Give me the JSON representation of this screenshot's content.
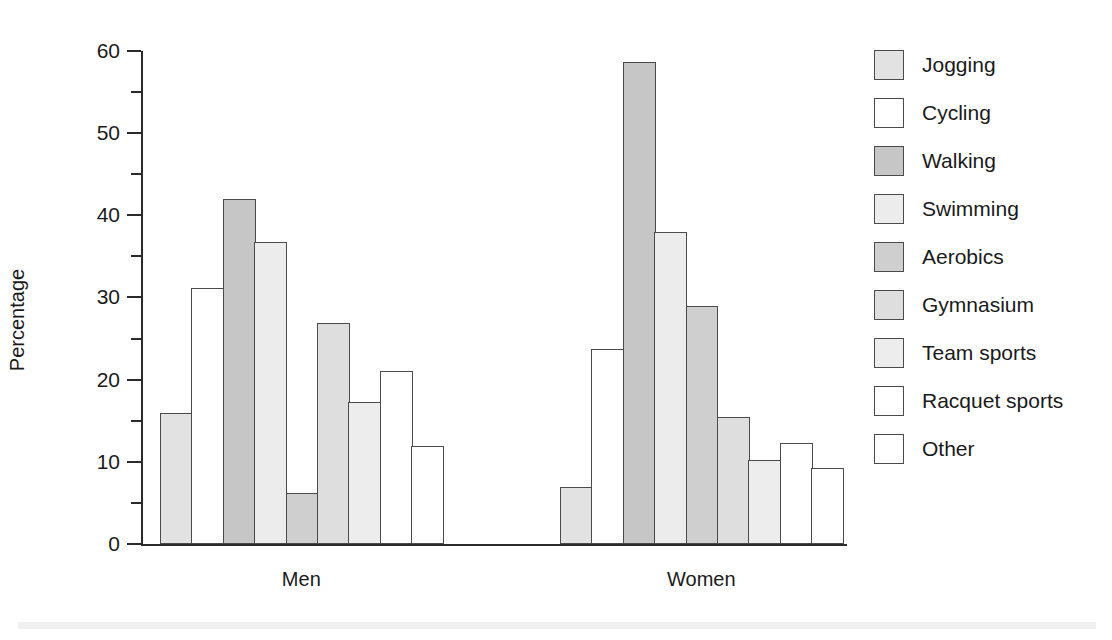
{
  "chart_data": {
    "type": "bar",
    "title": "",
    "xlabel": "",
    "ylabel": "Percentage",
    "ylim": [
      0,
      60
    ],
    "y_ticks_major": [
      0,
      10,
      20,
      30,
      40,
      50,
      60
    ],
    "y_tick_labels": [
      "0",
      "10",
      "20",
      "30",
      "40",
      "50",
      "60"
    ],
    "y_ticks_minor": [
      5,
      15,
      25,
      35,
      45,
      55
    ],
    "grid": false,
    "legend_position": "right",
    "categories": [
      "Men",
      "Women"
    ],
    "series": [
      {
        "name": "Jogging",
        "values": [
          15.9,
          6.9
        ],
        "color": "#e2e2e2"
      },
      {
        "name": "Cycling",
        "values": [
          31.2,
          23.7
        ],
        "color": "#ffffff"
      },
      {
        "name": "Walking",
        "values": [
          42.0,
          58.7
        ],
        "color": "#c6c6c6"
      },
      {
        "name": "Swimming",
        "values": [
          36.8,
          38.0
        ],
        "color": "#ececec"
      },
      {
        "name": "Aerobics",
        "values": [
          6.2,
          29.0
        ],
        "color": "#cfcfcf"
      },
      {
        "name": "Gymnasium",
        "values": [
          26.9,
          15.4
        ],
        "color": "#dedede"
      },
      {
        "name": "Team sports",
        "values": [
          17.3,
          10.2
        ],
        "color": "#ededed"
      },
      {
        "name": "Racquet sports",
        "values": [
          21.1,
          12.3
        ],
        "color": "#ffffff"
      },
      {
        "name": "Other",
        "values": [
          11.9,
          9.3
        ],
        "color": "#ffffff"
      }
    ]
  },
  "axes": {
    "y_title": "Percentage",
    "group_labels": [
      "Men",
      "Women"
    ]
  },
  "legend": {
    "entries": [
      {
        "label": "Jogging",
        "swatch": "#e2e2e2"
      },
      {
        "label": "Cycling",
        "swatch": "#ffffff"
      },
      {
        "label": "Walking",
        "swatch": "#c6c6c6"
      },
      {
        "label": "Swimming",
        "swatch": "#ececec"
      },
      {
        "label": "Aerobics",
        "swatch": "#cfcfcf"
      },
      {
        "label": "Gymnasium",
        "swatch": "#dedede"
      },
      {
        "label": "Team sports",
        "swatch": "#ededed"
      },
      {
        "label": "Racquet sports",
        "swatch": "#ffffff"
      },
      {
        "label": "Other",
        "swatch": "#ffffff"
      }
    ]
  },
  "colors": {
    "axis": "#2b2b2b",
    "bar_outline": "#4a4a4a",
    "text": "#1a1a1a",
    "background": "#ffffff"
  },
  "geometry": {
    "y_zero_px": 544,
    "y_top_px": 51,
    "px_per_unit": 8.2167,
    "group_origins_px": [
      160,
      560
    ],
    "bar_width_px": 31.4
  }
}
